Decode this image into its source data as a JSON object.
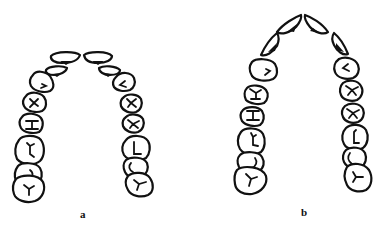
{
  "figure": {
    "panels": [
      {
        "id": "a",
        "label": "a",
        "description": "Dental arch with incisors arranged nearly flat (broad anterior curve)"
      },
      {
        "id": "b",
        "label": "b",
        "description": "Dental arch with incisors converging to a pointed V-shaped anterior"
      }
    ]
  },
  "colors": {
    "line": "#111111",
    "background": "#ffffff"
  }
}
